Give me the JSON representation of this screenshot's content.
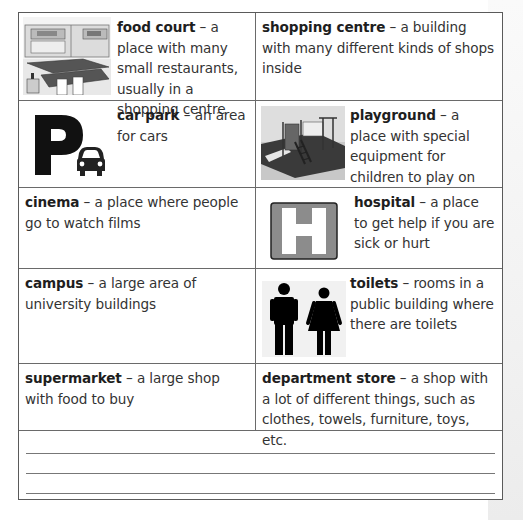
{
  "vocabulary": {
    "rows": [
      {
        "left": {
          "term": "food court",
          "definition": " – a place with many small restaurants, usually in a shopping centre",
          "icon": "food-court-illustration"
        },
        "right": {
          "term": "shopping centre",
          "definition": " – a building with many different kinds of shops inside"
        }
      },
      {
        "left": {
          "term": "car park",
          "definition": " – an area for cars",
          "icon": "parking-sign-icon"
        },
        "right": {
          "term": "playground",
          "definition": " – a place with special equipment for children to play on",
          "icon": "playground-illustration"
        }
      },
      {
        "left": {
          "term": "cinema",
          "definition": " – a place where people go to watch films"
        },
        "right": {
          "term": "hospital",
          "definition": " – a place to get help if you are sick or hurt",
          "icon": "hospital-sign-icon"
        }
      },
      {
        "left": {
          "term": "campus",
          "definition": " – a large area of university buildings"
        },
        "right": {
          "term": "toilets",
          "definition": " – rooms in a public building where there are toilets",
          "icon": "toilets-sign-icon"
        }
      },
      {
        "left": {
          "term": "supermarket",
          "definition": " – a large shop with food to buy"
        },
        "right": {
          "term": "department store",
          "definition": " – a shop with a lot of different things, such as clothes, towels, furniture, toys, etc."
        }
      }
    ],
    "writing_lines": 3
  },
  "colors": {
    "border": "#5a5a5a",
    "text": "#333333",
    "hospital_sign": "#8c8c8c",
    "side_strip": "#f0f0f0"
  }
}
